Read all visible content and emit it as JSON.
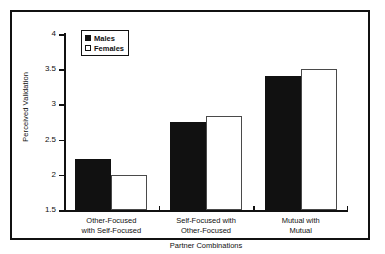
{
  "chart_data": {
    "type": "bar",
    "title": "",
    "xlabel": "Partner Combinations",
    "ylabel": "Perceived Validation",
    "ylim": [
      1.5,
      4
    ],
    "ytick_labels": [
      "4",
      "3.5",
      "3",
      "2.5",
      "2",
      "1.5"
    ],
    "yticks": [
      4,
      3.5,
      3,
      2.5,
      2,
      1.5
    ],
    "grid": false,
    "legend_position": "top-left-inside",
    "categories": [
      "Other-Focused with Self-Focused",
      "Self-Focused with Other-Focused",
      "Mutual with Mutual"
    ],
    "category_lines": [
      [
        "Other-Focused",
        "with Self-Focused"
      ],
      [
        "Self-Focused with",
        "Other-Focused"
      ],
      [
        "Mutual with",
        "Mutual"
      ]
    ],
    "series": [
      {
        "name": "Males",
        "color": "#111111",
        "fill": "solid-black",
        "values": [
          2.22,
          2.75,
          3.4
        ]
      },
      {
        "name": "Females",
        "color": "#ffffff",
        "fill": "open-white",
        "values": [
          2.0,
          2.84,
          3.5
        ]
      }
    ]
  },
  "legend": {
    "items": [
      {
        "label": "Males"
      },
      {
        "label": "Females"
      }
    ]
  },
  "axes": {
    "y_title": "Perceived Validation",
    "x_title": "Partner Combinations"
  },
  "colors": {
    "frame": "#111111",
    "axis": "#111111",
    "males_bar": "#111111",
    "females_bar": "#ffffff",
    "females_bar_border": "#4a4a4a",
    "background": "#ffffff"
  }
}
